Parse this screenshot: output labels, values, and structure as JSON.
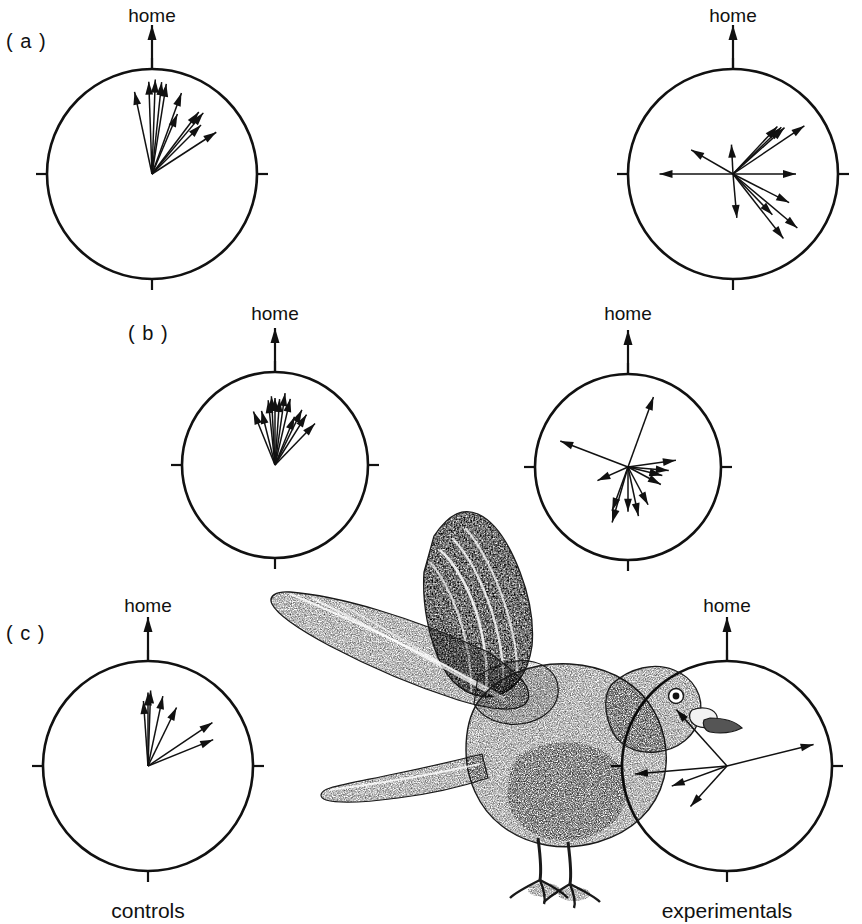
{
  "figure": {
    "width": 862,
    "height": 924,
    "background": "#ffffff",
    "ink_color": "#111111",
    "panel_letters": [
      "( a )",
      "( b )",
      "( c )"
    ],
    "home_label": "home",
    "controls_label": "controls",
    "experimentals_label": "experimentals",
    "illustration_name": "pigeon-landing-stipple-drawing"
  },
  "chart_data": {
    "type": "scatter",
    "title": "",
    "subtitle": "",
    "xlabel": "",
    "ylabel": "",
    "plot_kind": "circular-vanishing-bearing-diagram",
    "angle_convention": "degrees clockwise from home (0 deg = home = up)",
    "radius_convention": "vector length as fraction of circle radius (0-1)",
    "grid": false,
    "legend": "none",
    "tick_angles_deg": [
      0,
      90,
      180,
      270
    ],
    "home_direction_deg": 0,
    "panels": [
      {
        "row": "a",
        "letter": "( a )",
        "group": "controls",
        "home_label": "home",
        "center_px": [
          152,
          174
        ],
        "radius_px": 105,
        "n_vectors": 11,
        "vectors": [
          {
            "angle_deg": -12,
            "length": 0.8
          },
          {
            "angle_deg": -2,
            "length": 0.88
          },
          {
            "angle_deg": 2,
            "length": 0.9
          },
          {
            "angle_deg": 6,
            "length": 0.88
          },
          {
            "angle_deg": 9,
            "length": 0.87
          },
          {
            "angle_deg": 20,
            "length": 0.82
          },
          {
            "angle_deg": 23,
            "length": 0.62
          },
          {
            "angle_deg": 37,
            "length": 0.74
          },
          {
            "angle_deg": 40,
            "length": 0.76
          },
          {
            "angle_deg": 45,
            "length": 0.66
          },
          {
            "angle_deg": 57,
            "length": 0.73
          }
        ]
      },
      {
        "row": "a",
        "letter": "( a )",
        "group": "experimentals",
        "home_label": "home",
        "center_px": [
          733,
          174
        ],
        "radius_px": 105,
        "n_vectors": 13,
        "vectors": [
          {
            "angle_deg": -3,
            "length": 0.28
          },
          {
            "angle_deg": -60,
            "length": 0.46
          },
          {
            "angle_deg": -90,
            "length": 0.7
          },
          {
            "angle_deg": 43,
            "length": 0.62
          },
          {
            "angle_deg": 46,
            "length": 0.64
          },
          {
            "angle_deg": 48,
            "length": 0.66
          },
          {
            "angle_deg": 56,
            "length": 0.82
          },
          {
            "angle_deg": 90,
            "length": 0.6
          },
          {
            "angle_deg": 117,
            "length": 0.6
          },
          {
            "angle_deg": 130,
            "length": 0.8
          },
          {
            "angle_deg": 136,
            "length": 0.54
          },
          {
            "angle_deg": 142,
            "length": 0.78
          },
          {
            "angle_deg": 175,
            "length": 0.42
          }
        ]
      },
      {
        "row": "b",
        "letter": "( b )",
        "group": "controls",
        "home_label": "home",
        "center_px": [
          275,
          465
        ],
        "radius_px": 93,
        "n_vectors": 12,
        "vectors": [
          {
            "angle_deg": -22,
            "length": 0.62
          },
          {
            "angle_deg": -14,
            "length": 0.6
          },
          {
            "angle_deg": -6,
            "length": 0.7
          },
          {
            "angle_deg": -3,
            "length": 0.74
          },
          {
            "angle_deg": 0,
            "length": 0.72
          },
          {
            "angle_deg": 4,
            "length": 0.71
          },
          {
            "angle_deg": 8,
            "length": 0.78
          },
          {
            "angle_deg": 13,
            "length": 0.73
          },
          {
            "angle_deg": 22,
            "length": 0.56
          },
          {
            "angle_deg": 26,
            "length": 0.66
          },
          {
            "angle_deg": 32,
            "length": 0.64
          },
          {
            "angle_deg": 44,
            "length": 0.62
          }
        ]
      },
      {
        "row": "b",
        "letter": "( b )",
        "group": "experimentals",
        "home_label": "home",
        "center_px": [
          628,
          467
        ],
        "radius_px": 93,
        "n_vectors": 12,
        "vectors": [
          {
            "angle_deg": 20,
            "length": 0.8
          },
          {
            "angle_deg": 82,
            "length": 0.52
          },
          {
            "angle_deg": 95,
            "length": 0.44
          },
          {
            "angle_deg": 104,
            "length": 0.38
          },
          {
            "angle_deg": 118,
            "length": 0.4
          },
          {
            "angle_deg": 152,
            "length": 0.46
          },
          {
            "angle_deg": 168,
            "length": 0.54
          },
          {
            "angle_deg": 180,
            "length": 0.48
          },
          {
            "angle_deg": 196,
            "length": 0.62
          },
          {
            "angle_deg": 200,
            "length": 0.5
          },
          {
            "angle_deg": 246,
            "length": 0.36
          },
          {
            "angle_deg": 291,
            "length": 0.78
          }
        ]
      },
      {
        "row": "c",
        "letter": "( c )",
        "group": "controls",
        "home_label": "home",
        "center_px": [
          148,
          766
        ],
        "radius_px": 105,
        "n_vectors": 7,
        "vectors": [
          {
            "angle_deg": -4,
            "length": 0.62
          },
          {
            "angle_deg": 0,
            "length": 0.7
          },
          {
            "angle_deg": 2,
            "length": 0.72
          },
          {
            "angle_deg": 12,
            "length": 0.68
          },
          {
            "angle_deg": 26,
            "length": 0.62
          },
          {
            "angle_deg": 56,
            "length": 0.74
          },
          {
            "angle_deg": 68,
            "length": 0.67
          }
        ]
      },
      {
        "row": "c",
        "letter": "( c )",
        "group": "experimentals",
        "home_label": "home",
        "center_px": [
          727,
          766
        ],
        "radius_px": 105,
        "n_vectors": 5,
        "vectors": [
          {
            "angle_deg": 76,
            "length": 0.85
          },
          {
            "angle_deg": 222,
            "length": 0.52
          },
          {
            "angle_deg": 250,
            "length": 0.56
          },
          {
            "angle_deg": 265,
            "length": 0.88
          },
          {
            "angle_deg": 318,
            "length": 0.72
          }
        ]
      }
    ]
  }
}
